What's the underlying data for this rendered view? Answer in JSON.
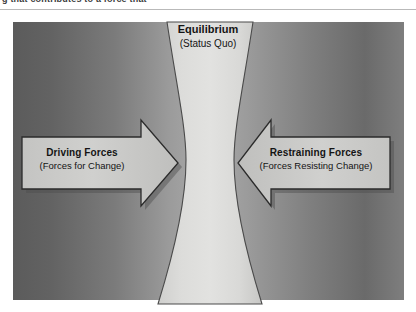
{
  "page": {
    "cropped_header_text": "g that contributes to a force that"
  },
  "diagram": {
    "equilibrium": {
      "title": "Equilibrium",
      "subtitle": "(Status Quo)"
    },
    "driving": {
      "title": "Driving Forces",
      "subtitle": "(Forces for Change)",
      "direction": "right"
    },
    "restraining": {
      "title": "Restraining Forces",
      "subtitle": "(Forces Resisting Change)",
      "direction": "left"
    }
  },
  "colors": {
    "panel_edge_dark": "#5b5b5b",
    "panel_center_light": "#ababab",
    "arrow_fill": "#c9c9c9",
    "arrow_stroke": "#2b2b2b",
    "hourglass_fill": "#d8d8d6",
    "hourglass_stroke": "#4a4a4a",
    "text": "#141414"
  }
}
